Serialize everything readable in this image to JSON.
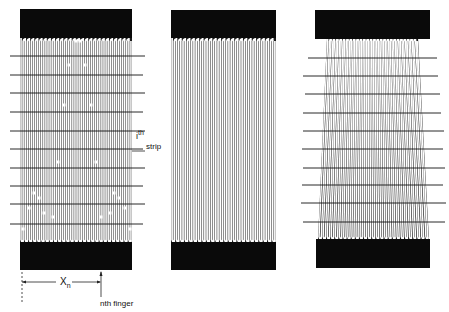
{
  "figure": {
    "panels": [
      {
        "id": "left",
        "description": "Interdigitated finger electrode with horizontal strips and defect dots",
        "finger_count": 27
      },
      {
        "id": "middle",
        "description": "Uniform interdigitated finger electrode",
        "finger_count": 24
      },
      {
        "id": "right",
        "description": "Tapered (trapezoidal) interdigitated finger electrode with horizontal strips",
        "finger_count": 27
      }
    ],
    "labels": {
      "strip_prefix": "i",
      "strip_sup": "th",
      "strip_word": "strip",
      "distance_var": "X",
      "distance_sub": "n",
      "finger_label": "nth finger"
    },
    "colors": {
      "bar": "#0a0a0a",
      "finger": "#ffffff",
      "gap": "#1a1a1a",
      "strip_line": "#111111",
      "background": "#ffffff"
    }
  }
}
